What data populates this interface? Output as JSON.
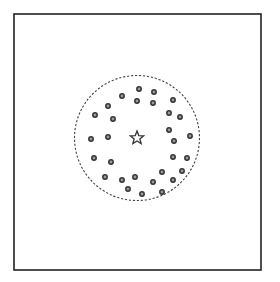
{
  "figure": {
    "width": 280,
    "height": 282,
    "background": "#ffffff",
    "frame": {
      "x": 14,
      "y": 14,
      "width": 247,
      "height": 256,
      "stroke": "#222222",
      "stroke_width": 1.6
    },
    "boundary_circle": {
      "cx": 137,
      "cy": 138,
      "r": 62.5,
      "stroke": "#444444",
      "stroke_width": 1.1,
      "dash": "2.2 1.8"
    },
    "center_star": {
      "cx": 137,
      "cy": 138,
      "outer_r": 7,
      "inner_r": 3,
      "stroke": "#333333",
      "stroke_width": 1.3,
      "fill": "#ffffff"
    },
    "dot_style": {
      "r": 2.2,
      "stroke": "#333333",
      "stroke_width": 1.5,
      "fill": "#9a9a9a"
    },
    "dots": [
      [
        139,
        89
      ],
      [
        154,
        92
      ],
      [
        122,
        96
      ],
      [
        137,
        101
      ],
      [
        153,
        103
      ],
      [
        173,
        100
      ],
      [
        108,
        106
      ],
      [
        95,
        115
      ],
      [
        113,
        119
      ],
      [
        169,
        113
      ],
      [
        180,
        117
      ],
      [
        91,
        139
      ],
      [
        108,
        137
      ],
      [
        169,
        130
      ],
      [
        174,
        141
      ],
      [
        190,
        136
      ],
      [
        94,
        158
      ],
      [
        111,
        162
      ],
      [
        173,
        157
      ],
      [
        187,
        158
      ],
      [
        105,
        177
      ],
      [
        122,
        180
      ],
      [
        135,
        177
      ],
      [
        162,
        172
      ],
      [
        182,
        171
      ],
      [
        128,
        189
      ],
      [
        142,
        194
      ],
      [
        153,
        182
      ],
      [
        162,
        192
      ],
      [
        173,
        180
      ]
    ]
  }
}
